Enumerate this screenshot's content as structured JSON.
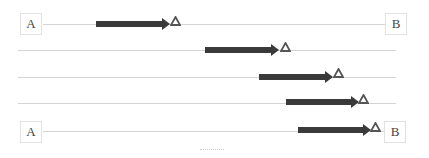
{
  "diagram": {
    "nodes": {
      "start_label": "A",
      "end_label": "B"
    },
    "rows": [
      {
        "line_y": 24,
        "line_x1": 43,
        "line_x2": 385,
        "arrow_x1": 96,
        "arrow_x2": 168,
        "marker_x": 170
      },
      {
        "line_y": 50,
        "line_x1": 18,
        "line_x2": 396,
        "arrow_x1": 205,
        "arrow_x2": 277,
        "marker_x": 280
      },
      {
        "line_y": 77,
        "line_x1": 18,
        "line_x2": 396,
        "arrow_x1": 259,
        "arrow_x2": 331,
        "marker_x": 333
      },
      {
        "line_y": 102,
        "line_x1": 18,
        "line_x2": 396,
        "arrow_x1": 286,
        "arrow_x2": 357,
        "marker_x": 358
      },
      {
        "line_y": 130,
        "line_x1": 43,
        "line_x2": 384,
        "arrow_x1": 298,
        "arrow_x2": 369,
        "marker_x": 370
      }
    ],
    "colors": {
      "arrow": "#3a3a3a",
      "marker_outline": "#555555",
      "line": "#d4d4d4",
      "box_border": "#e2e2e2"
    },
    "marker_icon": "hollow-triangle"
  }
}
